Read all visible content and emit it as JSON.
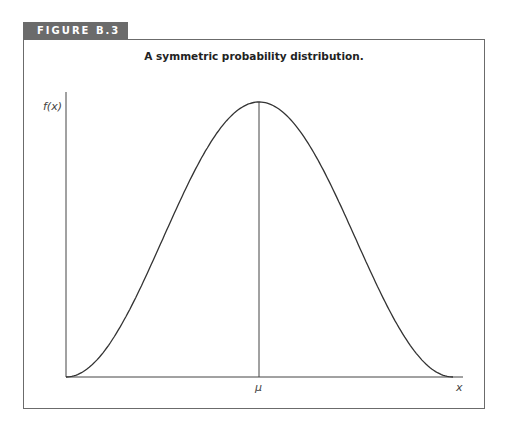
{
  "figure_label": "FIGURE B.3",
  "colors": {
    "tab_bg": "#6b6b6b",
    "tab_text": "#ffffff",
    "curve": "#333333",
    "frame": "#6b6b6b"
  },
  "chart_data": {
    "type": "line",
    "title": "A symmetric probability distribution.",
    "xlabel": "x",
    "ylabel": "f(x)",
    "x_tick_labels": [
      "μ"
    ],
    "grid": false,
    "legend": null,
    "annotations": [
      "vertical line at μ from x-axis to peak"
    ],
    "series": [
      {
        "name": "f(x)",
        "shape": "symmetric bell-shaped density, peak at μ",
        "x": [
          -1.0,
          -0.75,
          -0.5,
          -0.25,
          0.0,
          0.25,
          0.5,
          0.75,
          1.0
        ],
        "values": [
          0.0,
          0.15,
          0.5,
          0.85,
          1.0,
          0.85,
          0.5,
          0.15,
          0.0
        ]
      }
    ],
    "xlim": [
      -1.0,
      1.05
    ],
    "ylim": [
      0,
      1.05
    ]
  }
}
